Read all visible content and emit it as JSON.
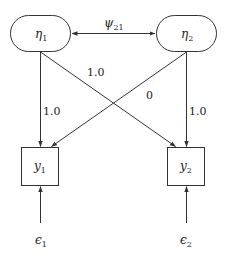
{
  "diagram": {
    "type": "path-diagram",
    "nodes": {
      "eta1": {
        "symbol": "η",
        "sub": "1",
        "shape": "rounded"
      },
      "eta2": {
        "symbol": "η",
        "sub": "2",
        "shape": "rounded"
      },
      "y1": {
        "symbol": "y",
        "sub": "1",
        "shape": "box"
      },
      "y2": {
        "symbol": "y",
        "sub": "2",
        "shape": "box"
      },
      "eps1": {
        "symbol": "ϵ",
        "sub": "1",
        "shape": "none"
      },
      "eps2": {
        "symbol": "ϵ",
        "sub": "2",
        "shape": "none"
      }
    },
    "edges": {
      "covariance": {
        "from": "eta1",
        "to": "eta2",
        "symbol": "ψ",
        "sub": "21",
        "bidirectional": true
      },
      "eta1_y1": {
        "from": "eta1",
        "to": "y1",
        "label": "1.0"
      },
      "eta1_y2": {
        "from": "eta1",
        "to": "y2",
        "label": "1.0"
      },
      "eta2_y1": {
        "from": "eta2",
        "to": "y1",
        "label": "0"
      },
      "eta2_y2": {
        "from": "eta2",
        "to": "y2",
        "label": "1.0"
      },
      "eps1_y1": {
        "from": "eps1",
        "to": "y1"
      },
      "eps2_y2": {
        "from": "eps2",
        "to": "y2"
      }
    }
  }
}
